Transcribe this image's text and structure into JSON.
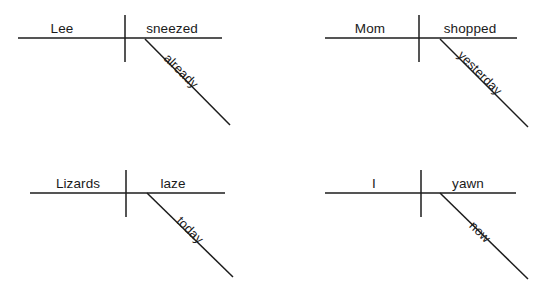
{
  "page": {
    "background_color": "#ffffff",
    "ink_color": "#1c1c1c",
    "text_color": "#1a1a1a"
  },
  "diagrams": [
    {
      "id": "diagram-1",
      "sentence": "Lee sneezed already.",
      "subject": "Lee",
      "verb": "sneezed",
      "modifier": "already",
      "modifier_attaches_to": "verb",
      "geometry": {
        "baseline": {
          "x1": 18,
          "y1": 38,
          "x2": 222,
          "y2": 38
        },
        "divider": {
          "x1": 125,
          "y1": 15,
          "x2": 125,
          "y2": 62
        },
        "diagonal": {
          "x1": 145,
          "y1": 39,
          "x2": 230,
          "y2": 125
        }
      },
      "labels": {
        "subject": {
          "x": 62,
          "y": 33
        },
        "verb": {
          "x": 140,
          "y": 33
        },
        "modifier": {
          "x": 172,
          "y": 70,
          "rotate": 45
        }
      }
    },
    {
      "id": "diagram-2",
      "sentence": "Mom shopped yesterday.",
      "subject": "Mom",
      "verb": "shopped",
      "modifier": "yesterday",
      "modifier_attaches_to": "verb",
      "geometry": {
        "baseline": {
          "x1": 325,
          "y1": 38,
          "x2": 517,
          "y2": 38
        },
        "divider": {
          "x1": 419,
          "y1": 15,
          "x2": 419,
          "y2": 62
        },
        "diagonal": {
          "x1": 440,
          "y1": 39,
          "x2": 528,
          "y2": 127
        }
      },
      "labels": {
        "subject": {
          "x": 352,
          "y": 33
        },
        "verb": {
          "x": 434,
          "y": 33
        },
        "modifier": {
          "x": 462,
          "y": 66,
          "rotate": 45
        }
      }
    },
    {
      "id": "diagram-3",
      "sentence": "Lizards laze today.",
      "subject": "Lizards",
      "verb": "laze",
      "modifier": "today",
      "modifier_attaches_to": "verb",
      "geometry": {
        "baseline": {
          "x1": 30,
          "y1": 193,
          "x2": 225,
          "y2": 193
        },
        "divider": {
          "x1": 126,
          "y1": 170,
          "x2": 126,
          "y2": 217
        },
        "diagonal": {
          "x1": 147,
          "y1": 193,
          "x2": 233,
          "y2": 277
        }
      },
      "labels": {
        "subject": {
          "x": 50,
          "y": 188
        },
        "verb": {
          "x": 157,
          "y": 188
        },
        "modifier": {
          "x": 180,
          "y": 226,
          "rotate": 45
        }
      }
    },
    {
      "id": "diagram-4",
      "sentence": "I yawn now.",
      "subject": "I",
      "verb": "yawn",
      "modifier": "now",
      "modifier_attaches_to": "verb",
      "geometry": {
        "baseline": {
          "x1": 325,
          "y1": 193,
          "x2": 516,
          "y2": 193
        },
        "divider": {
          "x1": 421,
          "y1": 170,
          "x2": 421,
          "y2": 217
        },
        "diagonal": {
          "x1": 440,
          "y1": 193,
          "x2": 528,
          "y2": 279
        }
      },
      "labels": {
        "subject": {
          "x": 374,
          "y": 188
        },
        "verb": {
          "x": 450,
          "y": 188
        },
        "modifier": {
          "x": 470,
          "y": 230,
          "rotate": 45
        }
      }
    }
  ]
}
